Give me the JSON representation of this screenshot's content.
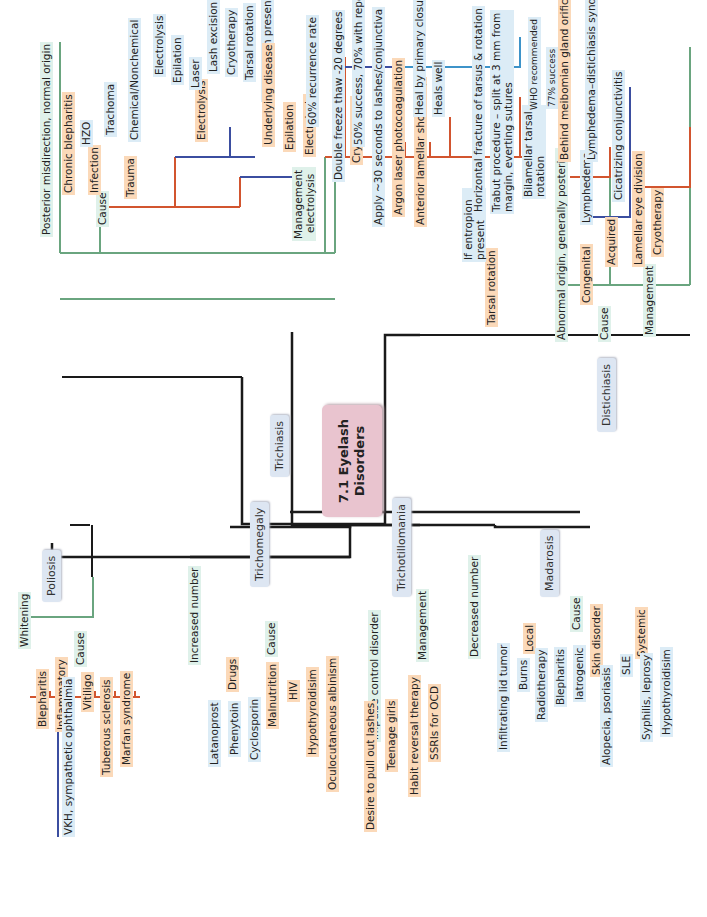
{
  "root": {
    "title_line1": "7.1 Eyelash",
    "title_line2": "Disorders"
  },
  "colors": {
    "root_bg": "#e9c4cf",
    "topic_bg": "#dde6f2",
    "green_line": "#6aa57f",
    "orange_line": "#d2552f",
    "blue_line": "#3b4ea0",
    "lightblue_line": "#3d93c9"
  },
  "trichiasis": {
    "label": "Trichiasis",
    "definition": "Posterior misdirection, normal origin",
    "cause": {
      "label": "Cause",
      "chronic_blepharitis": "Chronic blepharitis",
      "infection": "Infection",
      "hzo": "HZO",
      "trachoma": "Trachoma",
      "trauma": "Trauma",
      "chemical": "Chemical/Nonchemical"
    },
    "management": {
      "label_line1": "Management",
      "label_line2": "electrolysis",
      "electrolysis": "Electrolysis",
      "electrolysis_sub": [
        "Electrolysis",
        "Epilation",
        "Laser",
        "Lash excision",
        "Cryotherapy",
        "Tarsal rotation"
      ],
      "if_entropion": "If entropion present",
      "underlying_disease": "Underlying disease",
      "epilation": "Epilation",
      "electrolysis2": "Electrolysis",
      "recurrence": "60% recurrence rate",
      "cryotherapy": "Cryotherapy",
      "double_freeze": "Double freeze thaw -20 degrees",
      "success_50": "50% success, 70% with repeated",
      "apply_30": "Apply ~30 seconds to lashes/conjunctiva",
      "argon": "Argon laser photocoagulation",
      "anterior_strip": "Anterior lamellar short strip",
      "heal_primary": "Heal by primary closure",
      "heals_well": "Heals well",
      "tarsal_rotation": "Tarsal rotation",
      "if_entropion_line1": "If entropion",
      "if_entropion_line2": "present",
      "horizontal_fracture": "Horizontal fracture of tarsus & rotation",
      "trabut_line1": "Trabut procedure – split at 3 mm from",
      "trabut_line2": "margin, everting sutures",
      "bilamellar_line1": "Bilamellar tarsal",
      "bilamellar_line2": "rotation",
      "who": "WHO recommended",
      "success_77": "77% success"
    }
  },
  "distichiasis": {
    "label": "Distichiasis",
    "definition": "Abnormal origin, generally posterior",
    "behind": "Behind meibomian gland orifices",
    "cause": "Cause",
    "congenital": "Congenital",
    "lymphedema": "Lymphedema",
    "lds": "Lymphedema–distichiasis syndrome",
    "acquired": "Acquired",
    "cicatrizing": "Cicatrizing conjunctivitis",
    "management": "Management",
    "lamellar": "Lamellar eye division",
    "cryotherapy": "Cryotherapy"
  },
  "poliosis": {
    "label": "Poliosis",
    "definition": "Whitening",
    "cause": "Cause",
    "blepharitis": "Blepharitis",
    "inflammatory": "Inflammatory",
    "vkh": "VKH, sympathetic ophthalmia",
    "vitiligo": "Vitiligo",
    "tuberous": "Tuberous sclerosis",
    "marfan": "Marfan syndrome"
  },
  "trichomegaly": {
    "label": "Trichomegaly",
    "definition": "Increased number",
    "cause": "Cause",
    "drugs": "Drugs",
    "drug_list": [
      "Latanoprost",
      "Phenytoin",
      "Cyclosporin"
    ],
    "malnutrition": "Malnutrition",
    "hiv": "HIV",
    "hypothyroidism": "Hypothyroidisim",
    "oca": "Oculocutaneous  albinism"
  },
  "trichotillomania": {
    "label": "Trichotillomania",
    "definition": "Impulse control disorder",
    "desire": "Desire to pull out lashes",
    "teenage": "Teenage girls",
    "management": "Management",
    "habit": "Habit reversal therapy",
    "ssri": "SSRIs for OCD"
  },
  "madarosis": {
    "label": "Madarosis",
    "definition": "Decreased number",
    "cause": "Cause",
    "local": "Local",
    "infiltrating": "Infiltrating lid tumor",
    "local_list": [
      "Burns",
      "Radiotherapy",
      "Blepharitis",
      "Iatrogenic"
    ],
    "skin": "Skin disorder",
    "alopecia": "Alopecia, psoriasis",
    "systemic": "Systemic",
    "systemic_list": [
      "SLE",
      "Syphilis, leprosy",
      "Hypothyroidisim"
    ]
  }
}
